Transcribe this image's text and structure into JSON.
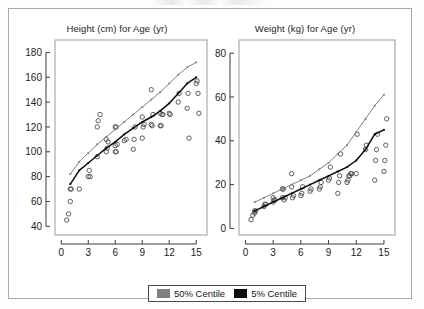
{
  "figure": {
    "legend": {
      "entries": [
        {
          "label": "50% Centile",
          "color": "#808080",
          "name": "legend-50-centile"
        },
        {
          "label": "5% Centile",
          "color": "#0d0d0d",
          "name": "legend-5-centile"
        }
      ]
    }
  },
  "chart_data": [
    {
      "type": "scatter",
      "panel": "left",
      "title": "Height (cm) for Age (yr)",
      "xlabel": "",
      "ylabel": "",
      "xlim": [
        -0.7,
        16.2
      ],
      "ylim": [
        33,
        190
      ],
      "xticks": [
        0,
        3,
        6,
        9,
        12,
        15
      ],
      "yticks": [
        40,
        60,
        80,
        100,
        120,
        140,
        160,
        180
      ],
      "grid": false,
      "legend_position": "bottom-center",
      "points": [
        [
          0.6,
          45
        ],
        [
          0.8,
          50
        ],
        [
          1.0,
          60
        ],
        [
          1.0,
          70
        ],
        [
          1.1,
          70
        ],
        [
          2.0,
          70
        ],
        [
          3.0,
          80
        ],
        [
          3.1,
          85
        ],
        [
          3.2,
          80
        ],
        [
          4.0,
          96
        ],
        [
          4.0,
          120
        ],
        [
          4.1,
          125
        ],
        [
          4.3,
          130
        ],
        [
          5.0,
          100
        ],
        [
          5.1,
          103
        ],
        [
          5.2,
          108
        ],
        [
          5.0,
          110
        ],
        [
          6.0,
          100
        ],
        [
          6.1,
          100
        ],
        [
          6.0,
          105
        ],
        [
          6.2,
          106
        ],
        [
          6.0,
          120
        ],
        [
          6.1,
          120
        ],
        [
          7.0,
          109
        ],
        [
          7.2,
          110
        ],
        [
          8.0,
          102
        ],
        [
          8.1,
          110
        ],
        [
          8.2,
          120
        ],
        [
          9.0,
          111
        ],
        [
          9.1,
          120
        ],
        [
          9.2,
          122
        ],
        [
          9.0,
          128
        ],
        [
          10.0,
          150
        ],
        [
          10.1,
          121
        ],
        [
          10.2,
          130
        ],
        [
          10.0,
          122
        ],
        [
          11.0,
          121
        ],
        [
          11.1,
          121
        ],
        [
          11.2,
          130
        ],
        [
          11.0,
          131
        ],
        [
          11.3,
          130
        ],
        [
          12.0,
          131
        ],
        [
          12.1,
          130
        ],
        [
          13.0,
          140
        ],
        [
          13.1,
          147
        ],
        [
          14.0,
          135
        ],
        [
          14.1,
          147
        ],
        [
          14.2,
          111
        ],
        [
          15.0,
          155
        ],
        [
          15.1,
          157
        ],
        [
          15.2,
          147
        ],
        [
          15.3,
          131
        ]
      ],
      "series": [
        {
          "name": "50% Centile",
          "color": "#808080",
          "x": [
            1,
            2,
            3,
            4,
            5,
            6,
            7,
            8,
            9,
            10,
            11,
            12,
            13,
            14,
            15
          ],
          "y": [
            82,
            92,
            99,
            106,
            112,
            118,
            124,
            130,
            136,
            142,
            148,
            155,
            162,
            168,
            172
          ]
        },
        {
          "name": "5% Centile",
          "color": "#0d0d0d",
          "x": [
            1,
            2,
            3,
            4,
            5,
            6,
            7,
            8,
            9,
            10,
            11,
            12,
            13,
            14,
            15
          ],
          "y": [
            74,
            85,
            91,
            97,
            103,
            108,
            114,
            119,
            124,
            128,
            133,
            139,
            147,
            155,
            160
          ]
        }
      ]
    },
    {
      "type": "scatter",
      "panel": "right",
      "title": "Weight (kg) for Age (yr)",
      "xlabel": "",
      "ylabel": "",
      "xlim": [
        -0.7,
        16.2
      ],
      "ylim": [
        -3,
        86
      ],
      "xticks": [
        0,
        3,
        6,
        9,
        12,
        15
      ],
      "yticks": [
        0,
        20,
        40,
        60,
        80
      ],
      "grid": false,
      "legend_position": "bottom-center",
      "points": [
        [
          0.6,
          4
        ],
        [
          0.8,
          6
        ],
        [
          1.0,
          7
        ],
        [
          1.1,
          8
        ],
        [
          1.0,
          8
        ],
        [
          2.0,
          10
        ],
        [
          2.1,
          11
        ],
        [
          2.2,
          11
        ],
        [
          3.0,
          12
        ],
        [
          3.1,
          13
        ],
        [
          3.2,
          13
        ],
        [
          3.0,
          14
        ],
        [
          4.0,
          18
        ],
        [
          4.1,
          18
        ],
        [
          4.2,
          13
        ],
        [
          4.0,
          14
        ],
        [
          4.3,
          14
        ],
        [
          5.0,
          25
        ],
        [
          5.1,
          14
        ],
        [
          5.2,
          15
        ],
        [
          5.0,
          19
        ],
        [
          6.0,
          15
        ],
        [
          6.1,
          16
        ],
        [
          6.2,
          19
        ],
        [
          7.0,
          17
        ],
        [
          7.1,
          18
        ],
        [
          8.0,
          18
        ],
        [
          8.1,
          19
        ],
        [
          8.2,
          21
        ],
        [
          9.0,
          22
        ],
        [
          9.1,
          23
        ],
        [
          9.2,
          28
        ],
        [
          10.0,
          16
        ],
        [
          10.1,
          21
        ],
        [
          10.2,
          24
        ],
        [
          10.3,
          34
        ],
        [
          11.0,
          21
        ],
        [
          11.1,
          22
        ],
        [
          11.2,
          24
        ],
        [
          11.3,
          24
        ],
        [
          11.4,
          25
        ],
        [
          11.5,
          25
        ],
        [
          12.0,
          25
        ],
        [
          12.1,
          43
        ],
        [
          13.0,
          36
        ],
        [
          13.1,
          38
        ],
        [
          14.0,
          22
        ],
        [
          14.1,
          31
        ],
        [
          14.2,
          36
        ],
        [
          14.3,
          43
        ],
        [
          15.0,
          26
        ],
        [
          15.1,
          31
        ],
        [
          15.2,
          38
        ],
        [
          15.3,
          50
        ]
      ],
      "series": [
        {
          "name": "50% Centile",
          "color": "#808080",
          "x": [
            1,
            2,
            3,
            4,
            5,
            6,
            7,
            8,
            9,
            10,
            11,
            12,
            13,
            14,
            15
          ],
          "y": [
            12,
            14,
            16,
            18,
            20,
            22,
            24,
            27,
            30,
            34,
            38,
            44,
            50,
            56,
            61
          ]
        },
        {
          "name": "5% Centile",
          "color": "#0d0d0d",
          "x": [
            1,
            2,
            3,
            4,
            5,
            6,
            7,
            8,
            9,
            10,
            11,
            12,
            13,
            14,
            15
          ],
          "y": [
            8,
            10,
            12,
            14,
            16,
            18,
            20,
            22,
            24,
            26,
            28,
            31,
            36,
            43,
            45
          ]
        }
      ]
    }
  ]
}
